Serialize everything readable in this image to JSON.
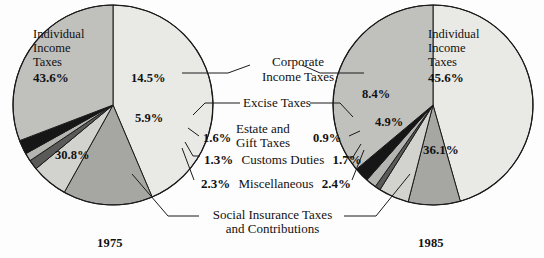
{
  "figure": {
    "title": "",
    "left_year": "1975",
    "right_year": "1985"
  },
  "categories": {
    "individual": "Individual\nIncome\nTaxes",
    "individual_l1": "Individual",
    "individual_l2": "Income",
    "individual_l3": "Taxes",
    "corporate_l1": "Corporate",
    "corporate_l2": "Income Taxes",
    "excise": "Excise Taxes",
    "estate_l1": "Estate and",
    "estate_l2": "Gift Taxes",
    "customs": "Customs Duties",
    "misc": "Miscellaneous",
    "social_l1": "Social Insurance Taxes",
    "social_l2": "and Contributions"
  },
  "left_values": {
    "individual": "43.6%",
    "corporate": "14.5%",
    "excise": "5.9%",
    "estate": "1.6%",
    "customs": "1.3%",
    "misc": "2.3%",
    "social": "30.8%"
  },
  "right_values": {
    "individual": "45.6%",
    "corporate": "8.4%",
    "excise": "4.9%",
    "estate": "0.9%",
    "customs": "1.7%",
    "misc": "2.4%",
    "social": "36.1%"
  },
  "colors": {
    "individual": "#e9e9e6",
    "corporate": "#a6a6a3",
    "excise": "#d2d2cf",
    "estate": "#5a5a58",
    "customs": "#b4b4b1",
    "misc": "#161616",
    "social": "#c0c0bd",
    "outline": "#1a1a1a",
    "text": "#111111",
    "background": "#fdfdfd"
  },
  "chart_data": {
    "type": "pie",
    "xlabel": "",
    "ylabel": "",
    "legend_position": "callouts",
    "grid": false,
    "categories": [
      "Individual Income Taxes",
      "Corporate Income Taxes",
      "Excise Taxes",
      "Estate and Gift Taxes",
      "Customs Duties",
      "Miscellaneous",
      "Social Insurance Taxes and Contributions"
    ],
    "charts": [
      {
        "name": "1975",
        "labels": [
          "Individual Income Taxes",
          "Corporate Income Taxes",
          "Excise Taxes",
          "Estate and Gift Taxes",
          "Customs Duties",
          "Miscellaneous",
          "Social Insurance Taxes and Contributions"
        ],
        "values": [
          43.6,
          14.5,
          5.9,
          1.6,
          1.3,
          2.3,
          30.8
        ],
        "value_labels": [
          "43.6%",
          "14.5%",
          "5.9%",
          "1.6%",
          "1.3%",
          "2.3%",
          "30.8%"
        ],
        "center": [
          113,
          105
        ],
        "radius": 100,
        "start_angle_deg": 0,
        "direction": "clockwise"
      },
      {
        "name": "1985",
        "labels": [
          "Individual Income Taxes",
          "Corporate Income Taxes",
          "Excise Taxes",
          "Estate and Gift Taxes",
          "Customs Duties",
          "Miscellaneous",
          "Social Insurance Taxes and Contributions"
        ],
        "values": [
          45.6,
          8.4,
          4.9,
          0.9,
          1.7,
          2.4,
          36.1
        ],
        "value_labels": [
          "45.6%",
          "8.4%",
          "4.9%",
          "0.9%",
          "1.7%",
          "2.4%",
          "36.1%"
        ],
        "center": [
          433,
          105
        ],
        "radius": 100,
        "start_angle_deg": 0,
        "direction": "clockwise"
      }
    ]
  }
}
